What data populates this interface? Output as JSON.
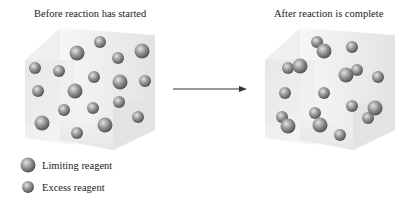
{
  "panels": {
    "before": {
      "title": "Before reaction has started"
    },
    "after": {
      "title": "After reaction is complete"
    }
  },
  "legend": {
    "items": [
      {
        "label": "Limiting reagent",
        "size": "large"
      },
      {
        "label": "Excess reagent",
        "size": "small"
      }
    ]
  },
  "colors": {
    "sphere_light": "#d8d8d8",
    "sphere_mid": "#8a8a8a",
    "sphere_dark": "#4a4a4a",
    "box_face": "#e9e9e9",
    "arrow": "#333333"
  },
  "spheres": {
    "before": [
      {
        "x": 100,
        "y": 42,
        "r": 6
      },
      {
        "x": 77,
        "y": 53,
        "r": 7.5
      },
      {
        "x": 142,
        "y": 51,
        "r": 7.5
      },
      {
        "x": 118,
        "y": 58,
        "r": 6
      },
      {
        "x": 35,
        "y": 68,
        "r": 6
      },
      {
        "x": 59,
        "y": 71,
        "r": 6
      },
      {
        "x": 94,
        "y": 77,
        "r": 6
      },
      {
        "x": 120,
        "y": 82,
        "r": 7.5
      },
      {
        "x": 145,
        "y": 81,
        "r": 6
      },
      {
        "x": 38,
        "y": 91,
        "r": 6
      },
      {
        "x": 75,
        "y": 91,
        "r": 7.5
      },
      {
        "x": 64,
        "y": 110,
        "r": 6
      },
      {
        "x": 93,
        "y": 108,
        "r": 6
      },
      {
        "x": 119,
        "y": 102,
        "r": 6
      },
      {
        "x": 42,
        "y": 123,
        "r": 7.5
      },
      {
        "x": 105,
        "y": 125,
        "r": 7.5
      },
      {
        "x": 138,
        "y": 117,
        "r": 6
      },
      {
        "x": 77,
        "y": 133,
        "r": 6
      }
    ],
    "after": [
      {
        "x": 317,
        "y": 42,
        "r": 6
      },
      {
        "x": 324,
        "y": 51,
        "r": 7.5
      },
      {
        "x": 352,
        "y": 47,
        "r": 6
      },
      {
        "x": 288,
        "y": 68,
        "r": 6
      },
      {
        "x": 300,
        "y": 66,
        "r": 7.5
      },
      {
        "x": 357,
        "y": 70,
        "r": 6
      },
      {
        "x": 346,
        "y": 75,
        "r": 7.5
      },
      {
        "x": 378,
        "y": 77,
        "r": 6
      },
      {
        "x": 285,
        "y": 93,
        "r": 6
      },
      {
        "x": 324,
        "y": 93,
        "r": 6
      },
      {
        "x": 352,
        "y": 106,
        "r": 6
      },
      {
        "x": 368,
        "y": 118,
        "r": 6
      },
      {
        "x": 375,
        "y": 108,
        "r": 7.5
      },
      {
        "x": 282,
        "y": 117,
        "r": 6
      },
      {
        "x": 288,
        "y": 126,
        "r": 7.5
      },
      {
        "x": 315,
        "y": 113,
        "r": 6
      },
      {
        "x": 320,
        "y": 125,
        "r": 7.5
      },
      {
        "x": 340,
        "y": 135,
        "r": 6
      }
    ]
  }
}
